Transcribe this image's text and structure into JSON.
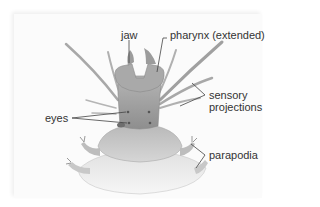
{
  "figure": {
    "labels": {
      "jaw": "jaw",
      "pharynx": "pharynx (extended)",
      "sensory_line1": "sensory",
      "sensory_line2": "projections",
      "eyes": "eyes",
      "parapodia": "parapodia"
    },
    "colors": {
      "background": "#ffffff",
      "panel": "#fbfbfb",
      "body_dark": "#9a9a9a",
      "body_mid": "#bdbdbd",
      "body_light": "#e2e2e2",
      "leader_line": "#444444",
      "text": "#333333"
    }
  }
}
